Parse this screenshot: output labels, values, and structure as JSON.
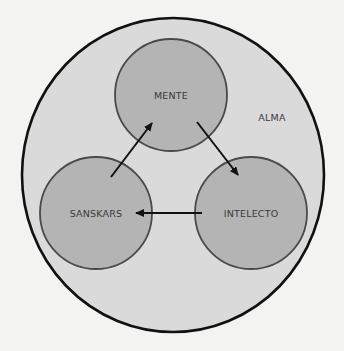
{
  "diagram": {
    "outer": {
      "label": "ALMA",
      "cx": 173,
      "cy": 175,
      "rx": 151,
      "ry": 157,
      "fill": "#dadada",
      "stroke": "#111111",
      "label_x": 272,
      "label_y": 121
    },
    "nodes": [
      {
        "id": "mente",
        "label": "MENTE",
        "cx": 171,
        "cy": 95,
        "r": 56
      },
      {
        "id": "sanskars",
        "label": "SANSKARS",
        "cx": 96,
        "cy": 213,
        "r": 56
      },
      {
        "id": "intelecto",
        "label": "INTELECTO",
        "cx": 251,
        "cy": 213,
        "r": 56
      }
    ],
    "node_style": {
      "fill": "#b4b4b4",
      "stroke": "#4a4a4a"
    },
    "edges": [
      {
        "from": "SANSKARS",
        "to": "MENTE",
        "x1": 111,
        "y1": 177,
        "x2": 152,
        "y2": 123
      },
      {
        "from": "MENTE",
        "to": "INTELECTO",
        "x1": 197,
        "y1": 122,
        "x2": 238,
        "y2": 175
      },
      {
        "from": "INTELECTO",
        "to": "SANSKARS",
        "x1": 202,
        "y1": 213,
        "x2": 136,
        "y2": 213
      }
    ],
    "edge_color": "#111111"
  }
}
